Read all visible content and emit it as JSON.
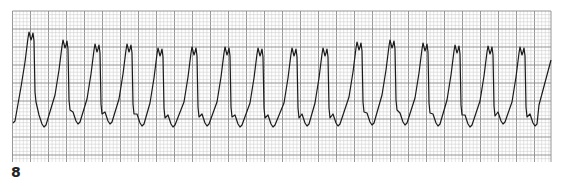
{
  "figure": {
    "label": "8"
  },
  "grid": {
    "x0": 12.5,
    "y0": 11,
    "x1": 551,
    "y1": 162,
    "minor": 3.6,
    "major_every": 5,
    "minor_color": "#c8c8c8",
    "major_color": "#8a8a8a",
    "trace_color": "#1a1a1a"
  },
  "chart_data": {
    "type": "line",
    "title": "",
    "xlabel": "",
    "ylabel": "",
    "grid": true,
    "legend": null,
    "complex_peak_x_px": [
      29,
      63,
      95,
      127,
      158,
      192,
      225,
      258,
      292,
      323,
      357,
      390,
      423,
      455,
      488,
      520
    ],
    "complex_peak_y_px": [
      32,
      40,
      44,
      44,
      48,
      47,
      47,
      48,
      48,
      48,
      42,
      40,
      43,
      45,
      46,
      47
    ],
    "trough_y_px": [
      127,
      124,
      124,
      126,
      127,
      126,
      127,
      127,
      126,
      126,
      125,
      125,
      126,
      127,
      124,
      126
    ],
    "start_point": [
      13,
      123
    ],
    "end_point": [
      551,
      60
    ]
  }
}
